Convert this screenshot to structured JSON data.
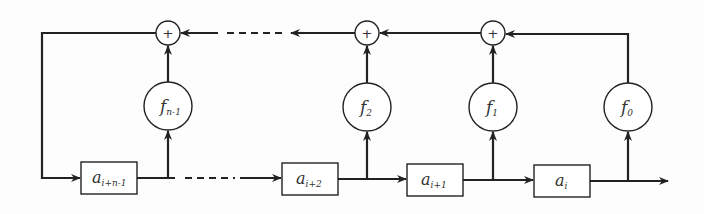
{
  "diagram": {
    "type": "linear feedback shift register",
    "registers": [
      {
        "id": "r0",
        "base": "a",
        "sub": "i+n-1"
      },
      {
        "id": "r1",
        "base": "a",
        "sub": "i+2"
      },
      {
        "id": "r2",
        "base": "a",
        "sub": "i+1"
      },
      {
        "id": "r3",
        "base": "a",
        "sub": "i"
      }
    ],
    "multipliers": [
      {
        "id": "m0",
        "base": "f",
        "sub": "n-1"
      },
      {
        "id": "m1",
        "base": "f",
        "sub": "2"
      },
      {
        "id": "m2",
        "base": "f",
        "sub": "1"
      },
      {
        "id": "m3",
        "base": "f",
        "sub": "0"
      }
    ],
    "adders": [
      {
        "id": "s0",
        "symbol": "+"
      },
      {
        "id": "s1",
        "symbol": "+"
      },
      {
        "id": "s2",
        "symbol": "+"
      }
    ],
    "colors": {
      "stroke": "#222222",
      "background": "#fdfdfd"
    }
  }
}
